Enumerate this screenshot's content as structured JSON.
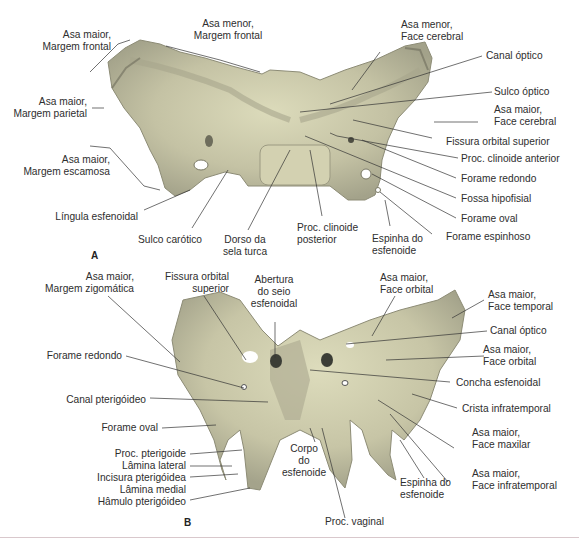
{
  "figure": {
    "panels": [
      {
        "id": "A",
        "letter": "A",
        "view": "superior view of sphenoid bone",
        "labels": {
          "asa_maior_margem_frontal": [
            "Asa maior,",
            "Margem frontal"
          ],
          "asa_menor_margem_frontal": [
            "Asa menor,",
            "Margem frontal"
          ],
          "asa_menor_face_cerebral": [
            "Asa menor,",
            "Face cerebral"
          ],
          "canal_optico": "Canal óptico",
          "asa_maior_margem_parietal": [
            "Asa maior,",
            "Margem parietal"
          ],
          "sulco_optico": "Sulco óptico",
          "asa_maior_face_cerebral": [
            "Asa maior,",
            "Face cerebral"
          ],
          "fissura_orbital_superior": "Fissura orbital superior",
          "asa_maior_margem_escamosa": [
            "Asa maior,",
            "Margem escamosa"
          ],
          "proc_clinoide_anterior": "Proc. clinoide anterior",
          "forame_redondo": "Forame redondo",
          "fossa_hipofisial": "Fossa hipofisial",
          "lingula_esfenoidal": "Língula esfenoidal",
          "forame_oval": "Forame oval",
          "forame_espinhoso": "Forame espinhoso",
          "sulco_carotico": "Sulco carótico",
          "dorso_sela_turca": [
            "Dorso da",
            "sela turca"
          ],
          "proc_clinoide_posterior": [
            "Proc. clinoide",
            "posterior"
          ],
          "espinha_esfenoide": [
            "Espinha do",
            "esfenoide"
          ]
        }
      },
      {
        "id": "B",
        "letter": "B",
        "view": "anterior view of sphenoid bone",
        "labels": {
          "asa_maior_margem_zigomatica": [
            "Asa maior,",
            "Margem zigomática"
          ],
          "fissura_orbital_superior": [
            "Fissura orbital",
            "superior"
          ],
          "abertura_seio": [
            "Abertura",
            "do seio",
            "esfenoidal"
          ],
          "asa_maior_face_orbital_top": [
            "Asa maior,",
            "Face orbital"
          ],
          "asa_maior_face_temporal": [
            "Asa maior,",
            "Face temporal"
          ],
          "canal_optico": "Canal óptico",
          "asa_maior_face_orbital": [
            "Asa maior,",
            "Face orbital"
          ],
          "forame_redondo": "Forame redondo",
          "concha_esfenoidal": "Concha esfenoidal",
          "canal_pterigoideo": "Canal pterigóideo",
          "crista_infratemporal": "Crista infratemporal",
          "forame_oval": "Forame oval",
          "asa_maior_face_maxilar": [
            "Asa maior,",
            "Face maxilar"
          ],
          "corpo_esfenoide": [
            "Corpo",
            "do",
            "esfenoide"
          ],
          "proc_pterigoide": "Proc. pterigoide",
          "lamina_lateral": "Lâmina lateral",
          "incisura_pterigoidea": "Incisura pterigóidea",
          "lamina_medial": "Lâmina medial",
          "hamulo_pterigoideo": "Hâmulo pterigóideo",
          "espinha_esfenoide": [
            "Espinha do",
            "esfenoide"
          ],
          "asa_maior_face_infratemporal": [
            "Asa maior,",
            "Face infratemporal"
          ],
          "proc_vaginal": "Proc. vaginal"
        }
      }
    ],
    "colors": {
      "bone_light": "#d8d6b4",
      "bone_mid": "#b9b79a",
      "bone_dark": "#8e8e78",
      "leader": "#333333",
      "text": "#2e2e2e",
      "rule": "#d9c8cc"
    }
  }
}
